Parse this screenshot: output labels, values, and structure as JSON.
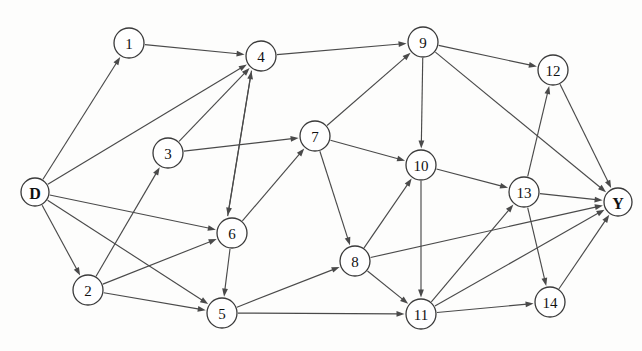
{
  "figure": {
    "background_color": "#fdfdfc",
    "node_fill": "#ffffff",
    "node_stroke": "#3a3a3a",
    "edge_color": "#4a4a4a",
    "width": 642,
    "height": 351
  },
  "graph": {
    "type": "directed-graph",
    "node_radius": 15,
    "terminal_node_radius": 14,
    "source": "D",
    "sink": "Y",
    "node_count": 16,
    "edge_count": 33,
    "nodes": [
      {
        "id": "D",
        "label": "D",
        "x": 35,
        "y": 192,
        "r": 14,
        "terminal": true
      },
      {
        "id": "1",
        "label": "1",
        "x": 129,
        "y": 43,
        "r": 15,
        "terminal": false
      },
      {
        "id": "2",
        "label": "2",
        "x": 88,
        "y": 290,
        "r": 15,
        "terminal": false
      },
      {
        "id": "3",
        "label": "3",
        "x": 168,
        "y": 153,
        "r": 15,
        "terminal": false
      },
      {
        "id": "4",
        "label": "4",
        "x": 261,
        "y": 56,
        "r": 15,
        "terminal": false
      },
      {
        "id": "5",
        "label": "5",
        "x": 222,
        "y": 313,
        "r": 15,
        "terminal": false
      },
      {
        "id": "6",
        "label": "6",
        "x": 232,
        "y": 233,
        "r": 15,
        "terminal": false
      },
      {
        "id": "7",
        "label": "7",
        "x": 315,
        "y": 136,
        "r": 15,
        "terminal": false
      },
      {
        "id": "8",
        "label": "8",
        "x": 355,
        "y": 261,
        "r": 15,
        "terminal": false
      },
      {
        "id": "9",
        "label": "9",
        "x": 423,
        "y": 42,
        "r": 15,
        "terminal": false
      },
      {
        "id": "10",
        "label": "10",
        "x": 421,
        "y": 165,
        "r": 15,
        "terminal": false
      },
      {
        "id": "11",
        "label": "11",
        "x": 421,
        "y": 314,
        "r": 15,
        "terminal": false
      },
      {
        "id": "12",
        "label": "12",
        "x": 553,
        "y": 70,
        "r": 15,
        "terminal": false
      },
      {
        "id": "13",
        "label": "13",
        "x": 524,
        "y": 192,
        "r": 15,
        "terminal": false
      },
      {
        "id": "14",
        "label": "14",
        "x": 550,
        "y": 302,
        "r": 15,
        "terminal": false
      },
      {
        "id": "Y",
        "label": "Y",
        "x": 618,
        "y": 202,
        "r": 14,
        "terminal": true
      }
    ],
    "edges": [
      {
        "from": "D",
        "to": "1"
      },
      {
        "from": "D",
        "to": "4"
      },
      {
        "from": "D",
        "to": "6"
      },
      {
        "from": "D",
        "to": "2"
      },
      {
        "from": "D",
        "to": "5"
      },
      {
        "from": "1",
        "to": "4"
      },
      {
        "from": "2",
        "to": "3"
      },
      {
        "from": "2",
        "to": "6"
      },
      {
        "from": "2",
        "to": "5"
      },
      {
        "from": "3",
        "to": "4"
      },
      {
        "from": "3",
        "to": "7"
      },
      {
        "from": "4",
        "to": "9"
      },
      {
        "from": "4",
        "to": "6"
      },
      {
        "from": "6",
        "to": "4"
      },
      {
        "from": "6",
        "to": "7"
      },
      {
        "from": "6",
        "to": "5"
      },
      {
        "from": "5",
        "to": "8"
      },
      {
        "from": "5",
        "to": "11"
      },
      {
        "from": "7",
        "to": "9"
      },
      {
        "from": "7",
        "to": "10"
      },
      {
        "from": "7",
        "to": "8"
      },
      {
        "from": "8",
        "to": "10"
      },
      {
        "from": "8",
        "to": "11"
      },
      {
        "from": "8",
        "to": "Y"
      },
      {
        "from": "9",
        "to": "10"
      },
      {
        "from": "9",
        "to": "12"
      },
      {
        "from": "9",
        "to": "Y"
      },
      {
        "from": "10",
        "to": "11"
      },
      {
        "from": "10",
        "to": "13"
      },
      {
        "from": "11",
        "to": "13"
      },
      {
        "from": "11",
        "to": "14"
      },
      {
        "from": "11",
        "to": "Y"
      },
      {
        "from": "12",
        "to": "Y"
      },
      {
        "from": "13",
        "to": "12"
      },
      {
        "from": "13",
        "to": "14"
      },
      {
        "from": "13",
        "to": "Y"
      },
      {
        "from": "14",
        "to": "Y"
      }
    ]
  }
}
